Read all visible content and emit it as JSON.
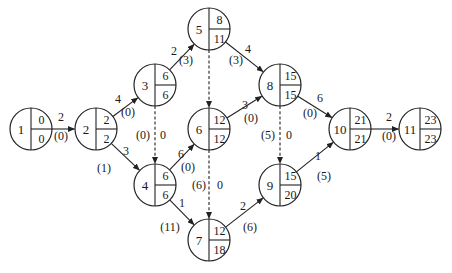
{
  "diagram": {
    "type": "activity-on-node network (time-scaled precedence diagram)",
    "node_radius": 21,
    "nodes": [
      {
        "id": "1",
        "x": 31,
        "y": 129,
        "top": "0",
        "bottom": "0"
      },
      {
        "id": "2",
        "x": 96,
        "y": 129,
        "top": "2",
        "bottom": "2"
      },
      {
        "id": "3",
        "x": 155,
        "y": 85,
        "top": "6",
        "bottom": "6"
      },
      {
        "id": "4",
        "x": 155,
        "y": 185,
        "top": "6",
        "bottom": "6"
      },
      {
        "id": "5",
        "x": 209,
        "y": 29,
        "top": "8",
        "bottom": "11"
      },
      {
        "id": "6",
        "x": 209,
        "y": 129,
        "top": "12",
        "bottom": "12"
      },
      {
        "id": "7",
        "x": 209,
        "y": 240,
        "top": "12",
        "bottom": "18"
      },
      {
        "id": "8",
        "x": 280,
        "y": 85,
        "top": "15",
        "bottom": "15"
      },
      {
        "id": "9",
        "x": 280,
        "y": 185,
        "top": "15",
        "bottom": "20"
      },
      {
        "id": "10",
        "x": 350,
        "y": 129,
        "top": "21",
        "bottom": "21"
      },
      {
        "id": "11",
        "x": 420,
        "y": 129,
        "top": "23",
        "bottom": "23"
      }
    ],
    "edges": [
      {
        "from": "1",
        "to": "2",
        "dashed": false,
        "duration": "2",
        "float": "(0)",
        "dur_pos": [
          61,
          121
        ],
        "float_pos": [
          61,
          140
        ]
      },
      {
        "from": "2",
        "to": "3",
        "dashed": false,
        "duration": "4",
        "float": "(0)",
        "dur_pos": [
          118,
          103
        ],
        "float_pos": [
          128,
          116
        ]
      },
      {
        "from": "2",
        "to": "4",
        "dashed": false,
        "duration": "3",
        "float": "(1)",
        "dur_pos": [
          126,
          155
        ],
        "float_pos": [
          104,
          172
        ]
      },
      {
        "from": "3",
        "to": "5",
        "dashed": false,
        "duration": "2",
        "float": "(3)",
        "dur_pos": [
          174,
          55
        ],
        "float_pos": [
          186,
          64
        ]
      },
      {
        "from": "3",
        "to": "4",
        "dashed": true,
        "duration": "0",
        "float": "(0)",
        "dur_pos": [
          163,
          139
        ],
        "float_pos": [
          143,
          139
        ]
      },
      {
        "from": "4",
        "to": "6",
        "dashed": false,
        "duration": "6",
        "float": "(0)",
        "dur_pos": [
          181,
          158
        ],
        "float_pos": [
          188,
          171
        ]
      },
      {
        "from": "4",
        "to": "7",
        "dashed": false,
        "duration": "1",
        "float": "(11)",
        "dur_pos": [
          182,
          207
        ],
        "float_pos": [
          170,
          231
        ]
      },
      {
        "from": "5",
        "to": "6",
        "dashed": true,
        "duration": "",
        "float": "",
        "dur_pos": [
          0,
          0
        ],
        "float_pos": [
          0,
          0
        ]
      },
      {
        "from": "5",
        "to": "8",
        "dashed": false,
        "duration": "4",
        "float": "(3)",
        "dur_pos": [
          248,
          53
        ],
        "float_pos": [
          236,
          64
        ]
      },
      {
        "from": "6",
        "to": "8",
        "dashed": false,
        "duration": "3",
        "float": "(0)",
        "dur_pos": [
          245,
          109
        ],
        "float_pos": [
          251,
          122
        ]
      },
      {
        "from": "6",
        "to": "7",
        "dashed": true,
        "duration": "0",
        "float": "(6)",
        "dur_pos": [
          220,
          189
        ],
        "float_pos": [
          199,
          189
        ]
      },
      {
        "from": "7",
        "to": "9",
        "dashed": false,
        "duration": "2",
        "float": "(6)",
        "dur_pos": [
          243,
          210
        ],
        "float_pos": [
          250,
          231
        ]
      },
      {
        "from": "8",
        "to": "10",
        "dashed": false,
        "duration": "6",
        "float": "(0)",
        "dur_pos": [
          320,
          102
        ],
        "float_pos": [
          310,
          117
        ]
      },
      {
        "from": "8",
        "to": "9",
        "dashed": true,
        "duration": "0",
        "float": "(5)",
        "dur_pos": [
          289,
          139
        ],
        "float_pos": [
          268,
          139
        ]
      },
      {
        "from": "9",
        "to": "10",
        "dashed": false,
        "duration": "1",
        "float": "(5)",
        "dur_pos": [
          318,
          160
        ],
        "float_pos": [
          324,
          180
        ]
      },
      {
        "from": "10",
        "to": "11",
        "dashed": false,
        "duration": "2",
        "float": "(0)",
        "dur_pos": [
          389,
          121
        ],
        "float_pos": [
          389,
          140
        ]
      }
    ]
  }
}
